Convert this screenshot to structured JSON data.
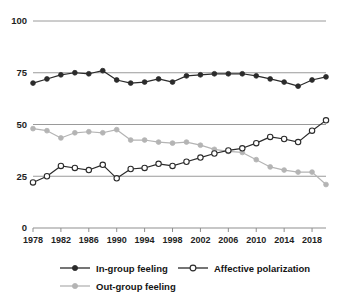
{
  "chart_data": {
    "type": "line",
    "title": "",
    "subtitle": "",
    "xlabel": "",
    "ylabel": "",
    "xlim": [
      1978,
      2020
    ],
    "ylim": [
      0,
      100
    ],
    "grid": true,
    "legend_position": "bottom",
    "ytick_labels": [
      "100",
      "75",
      "50",
      "25",
      "0"
    ],
    "ytick_values": [
      100,
      75,
      50,
      25,
      0
    ],
    "xtick_labels": [
      "1978",
      "1982",
      "1986",
      "1990",
      "1994",
      "1998",
      "2002",
      "2006",
      "2010",
      "2014",
      "2018"
    ],
    "xtick_values": [
      1978,
      1982,
      1986,
      1990,
      1994,
      1998,
      2002,
      2006,
      2010,
      2014,
      2018
    ],
    "x": [
      1978,
      1980,
      1982,
      1984,
      1986,
      1988,
      1990,
      1992,
      1994,
      1996,
      1998,
      2000,
      2002,
      2004,
      2006,
      2008,
      2010,
      2012,
      2014,
      2016,
      2018,
      2020
    ],
    "series": [
      {
        "name": "In-group feeling",
        "color": "#2b2b2b",
        "marker": "filled-circle",
        "values": [
          70,
          72,
          74,
          75,
          74.5,
          76,
          71.5,
          70,
          70.5,
          72,
          70.5,
          73.5,
          74,
          74.5,
          74.5,
          74.5,
          73.5,
          72,
          70.5,
          68.5,
          71.5,
          73
        ]
      },
      {
        "name": "Affective polarization",
        "color": "#2b2b2b",
        "marker": "open-circle",
        "values": [
          22,
          25,
          30,
          29,
          28,
          30.5,
          24,
          28.5,
          29,
          31,
          30,
          32,
          34,
          36,
          37.5,
          38.5,
          41,
          44,
          43,
          41.5,
          47,
          52
        ]
      },
      {
        "name": "Out-group feeling",
        "color": "#b4b4b4",
        "marker": "filled-circle",
        "values": [
          48,
          47,
          43.5,
          46,
          46.5,
          46,
          47.5,
          42.5,
          42.5,
          41.5,
          41,
          41.5,
          40,
          38,
          37,
          36.5,
          33,
          29.5,
          28,
          27,
          27,
          21
        ]
      }
    ]
  },
  "legend": {
    "items": [
      {
        "label": "In-group feeling",
        "color": "#2b2b2b",
        "marker": "filled-circle"
      },
      {
        "label": "Affective polarization",
        "color": "#2b2b2b",
        "marker": "open-circle"
      },
      {
        "label": "Out-group feeling",
        "color": "#b4b4b4",
        "marker": "filled-circle"
      }
    ]
  },
  "colors": {
    "ingroup": "#2b2b2b",
    "polarization": "#2b2b2b",
    "outgroup": "#b4b4b4",
    "grid": "#9a9a9a",
    "text": "#1a1a1a",
    "background": "#ffffff"
  }
}
